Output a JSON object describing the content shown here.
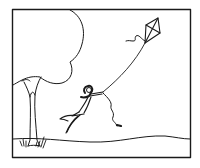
{
  "illustration": {
    "description": "Line drawing of a girl holding a kite string, lifted off the ground by the wind, next to a tree on a gently rolling hill, inside a rectangular frame",
    "elements": [
      "frame",
      "tree",
      "ground",
      "grass-tufts",
      "girl",
      "kite",
      "kite-string",
      "kite-tail",
      "ribbon"
    ],
    "colors": {
      "ink": "#1a1a1a",
      "background": "#ffffff"
    }
  }
}
